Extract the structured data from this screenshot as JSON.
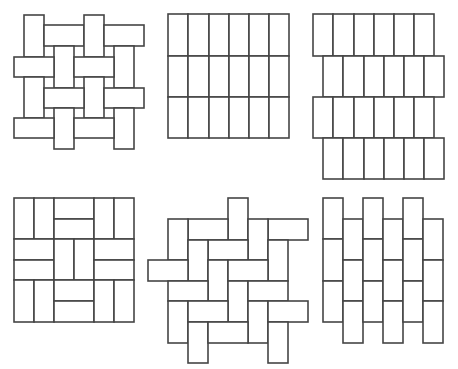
{
  "figure": {
    "stroke_color": "#454545",
    "fill_color": "#ffffff",
    "patterns": [
      {
        "name": "basket-weave-interlocking",
        "rects": [
          [
            24,
            15,
            20,
            42
          ],
          [
            44,
            25,
            40,
            21
          ],
          [
            84,
            15,
            20,
            42
          ],
          [
            104,
            25,
            40,
            21
          ],
          [
            54,
            46,
            20,
            42
          ],
          [
            114,
            46,
            20,
            42
          ],
          [
            14,
            57,
            40,
            20
          ],
          [
            74,
            57,
            40,
            20
          ],
          [
            24,
            77,
            20,
            41
          ],
          [
            84,
            77,
            20,
            41
          ],
          [
            44,
            88,
            40,
            20
          ],
          [
            104,
            88,
            40,
            20
          ],
          [
            54,
            108,
            20,
            41
          ],
          [
            114,
            108,
            20,
            41
          ],
          [
            14,
            118,
            40,
            20
          ],
          [
            74,
            118,
            40,
            20
          ]
        ]
      },
      {
        "name": "stack-bond-grid",
        "rects": [
          [
            168,
            14,
            20,
            42
          ],
          [
            188,
            14,
            21,
            42
          ],
          [
            209,
            14,
            20,
            42
          ],
          [
            229,
            14,
            20,
            42
          ],
          [
            249,
            14,
            20,
            42
          ],
          [
            269,
            14,
            20,
            42
          ],
          [
            168,
            56,
            20,
            41
          ],
          [
            188,
            56,
            21,
            41
          ],
          [
            209,
            56,
            20,
            41
          ],
          [
            229,
            56,
            20,
            41
          ],
          [
            249,
            56,
            20,
            41
          ],
          [
            269,
            56,
            20,
            41
          ],
          [
            168,
            97,
            20,
            41
          ],
          [
            188,
            97,
            21,
            41
          ],
          [
            209,
            97,
            20,
            41
          ],
          [
            229,
            97,
            20,
            41
          ],
          [
            249,
            97,
            20,
            41
          ],
          [
            269,
            97,
            20,
            41
          ]
        ]
      },
      {
        "name": "running-bond-offset-rows",
        "rects": [
          [
            313,
            14,
            20,
            42
          ],
          [
            333,
            14,
            21,
            42
          ],
          [
            354,
            14,
            20,
            42
          ],
          [
            374,
            14,
            20,
            42
          ],
          [
            394,
            14,
            20,
            42
          ],
          [
            414,
            14,
            20,
            42
          ],
          [
            323,
            56,
            20,
            41
          ],
          [
            343,
            56,
            21,
            41
          ],
          [
            364,
            56,
            20,
            41
          ],
          [
            384,
            56,
            20,
            41
          ],
          [
            404,
            56,
            20,
            41
          ],
          [
            424,
            56,
            20,
            41
          ],
          [
            313,
            97,
            20,
            41
          ],
          [
            333,
            97,
            21,
            41
          ],
          [
            354,
            97,
            20,
            41
          ],
          [
            374,
            97,
            20,
            41
          ],
          [
            394,
            97,
            20,
            41
          ],
          [
            414,
            97,
            20,
            41
          ],
          [
            323,
            138,
            20,
            41
          ],
          [
            343,
            138,
            21,
            41
          ],
          [
            364,
            138,
            20,
            41
          ],
          [
            384,
            138,
            20,
            41
          ],
          [
            404,
            138,
            20,
            41
          ],
          [
            424,
            138,
            20,
            41
          ]
        ]
      },
      {
        "name": "basket-weave-parquet",
        "rects": [
          [
            14,
            198,
            20,
            41
          ],
          [
            34,
            198,
            20,
            41
          ],
          [
            54,
            198,
            40,
            21
          ],
          [
            54,
            219,
            40,
            20
          ],
          [
            94,
            198,
            20,
            41
          ],
          [
            114,
            198,
            20,
            41
          ],
          [
            14,
            239,
            40,
            21
          ],
          [
            14,
            260,
            40,
            20
          ],
          [
            54,
            239,
            20,
            41
          ],
          [
            74,
            239,
            20,
            41
          ],
          [
            94,
            239,
            40,
            21
          ],
          [
            94,
            260,
            40,
            20
          ],
          [
            14,
            280,
            20,
            42
          ],
          [
            34,
            280,
            20,
            42
          ],
          [
            54,
            280,
            40,
            21
          ],
          [
            54,
            301,
            40,
            21
          ],
          [
            94,
            280,
            20,
            42
          ],
          [
            114,
            280,
            20,
            42
          ]
        ]
      },
      {
        "name": "herringbone",
        "rects": [
          [
            228,
            198,
            20,
            42
          ],
          [
            188,
            219,
            40,
            21
          ],
          [
            168,
            219,
            20,
            41
          ],
          [
            268,
            219,
            40,
            21
          ],
          [
            248,
            219,
            20,
            41
          ],
          [
            268,
            240,
            20,
            41
          ],
          [
            208,
            240,
            40,
            20
          ],
          [
            188,
            240,
            20,
            41
          ],
          [
            148,
            260,
            40,
            21
          ],
          [
            208,
            260,
            20,
            41
          ],
          [
            228,
            260,
            40,
            21
          ],
          [
            168,
            281,
            40,
            20
          ],
          [
            228,
            281,
            20,
            41
          ],
          [
            248,
            281,
            40,
            20
          ],
          [
            168,
            301,
            20,
            42
          ],
          [
            188,
            301,
            40,
            21
          ],
          [
            248,
            301,
            20,
            42
          ],
          [
            268,
            301,
            40,
            21
          ],
          [
            188,
            322,
            20,
            41
          ],
          [
            208,
            322,
            40,
            21
          ],
          [
            268,
            322,
            20,
            41
          ]
        ]
      },
      {
        "name": "stack-bond-offset-columns",
        "rects": [
          [
            323,
            198,
            20,
            41
          ],
          [
            323,
            239,
            20,
            42
          ],
          [
            323,
            281,
            20,
            41
          ],
          [
            343,
            219,
            20,
            41
          ],
          [
            343,
            260,
            20,
            41
          ],
          [
            343,
            301,
            20,
            42
          ],
          [
            363,
            198,
            20,
            41
          ],
          [
            363,
            239,
            20,
            42
          ],
          [
            363,
            281,
            20,
            41
          ],
          [
            383,
            219,
            20,
            41
          ],
          [
            383,
            260,
            20,
            41
          ],
          [
            383,
            301,
            20,
            42
          ],
          [
            403,
            198,
            20,
            41
          ],
          [
            403,
            239,
            20,
            42
          ],
          [
            403,
            281,
            20,
            41
          ],
          [
            423,
            219,
            20,
            41
          ],
          [
            423,
            260,
            20,
            41
          ],
          [
            423,
            301,
            20,
            42
          ]
        ]
      }
    ]
  }
}
